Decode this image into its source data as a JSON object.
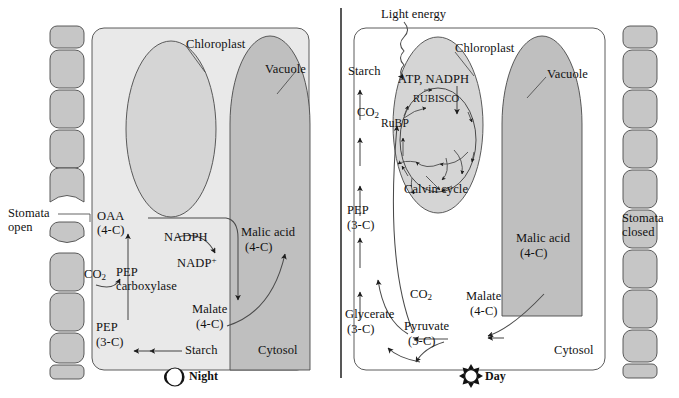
{
  "figure": {
    "title_visible": "",
    "panels": [
      {
        "id": "night",
        "phase_label": "Night",
        "phase_icon": "moon-icon",
        "stomata_label_line1": "Stomata",
        "stomata_label_line2": "open",
        "compartment_label": "Cytosol",
        "organelles": {
          "chloroplast": "Chloroplast",
          "vacuole": "Vacuole"
        },
        "metabolites": {
          "oaa_name": "OAA",
          "oaa_carbons": "(4-C)",
          "nadph": "NADPH",
          "nadp_plus": "NADP",
          "nadp_plus_charge": "+",
          "co2_name": "CO",
          "co2_sub": "2",
          "pep_enzyme_line1": "PEP",
          "pep_enzyme_line2": "carboxylase",
          "pep_name": "PEP",
          "pep_carbons": "(3-C)",
          "malate_name": "Malate",
          "malate_carbons": "(4-C)",
          "malic_acid_name": "Malic acid",
          "malic_acid_carbons": "(4-C)",
          "starch": "Starch"
        }
      },
      {
        "id": "day",
        "phase_label": "Day",
        "phase_icon": "sun-icon",
        "stomata_label_line1": "Stomata",
        "stomata_label_line2": "closed",
        "compartment_label": "Cytosol",
        "organelles": {
          "chloroplast": "Chloroplast",
          "vacuole": "Vacuole"
        },
        "metabolites": {
          "light_energy": "Light energy",
          "atp_nadph": "ATP, NADPH",
          "rubisco": "RUBISCO",
          "rubp": "RuBP",
          "calvin_cycle": "Calvin cycle",
          "starch": "Starch",
          "co2_upper_name": "CO",
          "co2_upper_sub": "2",
          "pep_name": "PEP",
          "pep_carbons": "(3-C)",
          "glycerate_name": "Glycerate",
          "glycerate_carbons": "(3-C)",
          "co2_lower_name": "CO",
          "co2_lower_sub": "2",
          "pyruvate_name": "Pyruvate",
          "pyruvate_carbons": "(3-C)",
          "malate_name": "Malate",
          "malate_carbons": "(4-C)",
          "malic_acid_name": "Malic acid",
          "malic_acid_carbons": "(4-C)"
        }
      }
    ]
  },
  "colors": {
    "background": "#ffffff",
    "cell_fill": "#e9e9e9",
    "chloroplast_fill": "#d5d5d5",
    "vacuole_fill": "#bfbfbf",
    "guard_cell_fill": "#c6c6c6",
    "stroke": "#4a4a4a",
    "text": "#111111"
  }
}
